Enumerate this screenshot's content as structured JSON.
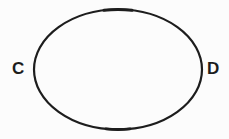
{
  "diagram": {
    "type": "ellipse",
    "labels": {
      "left": "C",
      "right": "D"
    },
    "colors": {
      "stroke": "#1d1d1d",
      "text": "#1d1d1d",
      "background": "#fcfcfc"
    }
  }
}
